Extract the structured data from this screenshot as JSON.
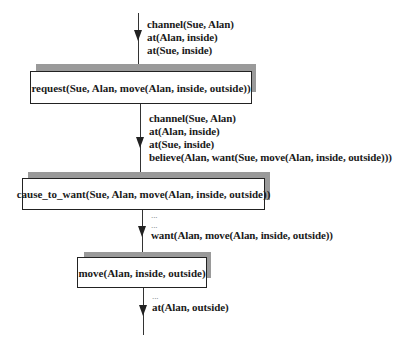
{
  "diagram": {
    "states": [
      {
        "lines": [
          "channel(Sue, Alan)",
          "at(Alan, inside)",
          "at(Sue, inside)"
        ]
      },
      {
        "lines": [
          "channel(Sue, Alan)",
          "at(Alan, inside)",
          "at(Sue, inside)",
          "believe(Alan, want(Sue, move(Alan, inside, outside)))"
        ]
      },
      {
        "lines": [
          "...",
          "...",
          "want(Alan, move(Alan, inside, outside))"
        ]
      },
      {
        "lines": [
          "...",
          "at(Alan, outside)"
        ]
      }
    ],
    "actions": [
      {
        "label": "request(Sue, Alan, move(Alan, inside, outside))"
      },
      {
        "label": "cause_to_want(Sue, Alan, move(Alan, inside, outside))"
      },
      {
        "label": "move(Alan, inside, outside)"
      }
    ]
  }
}
